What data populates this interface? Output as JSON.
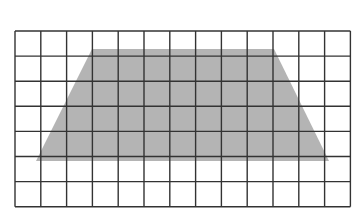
{
  "figure": {
    "type": "grid-diagram",
    "grid": {
      "columns": 13,
      "rows": 7,
      "origin_x": 15,
      "origin_y": 31,
      "cell_width": 25.8,
      "cell_height": 25.1,
      "line_color": "#333333",
      "background": "#ffffff"
    },
    "shape": {
      "name": "trapezoid",
      "fill": "#b4b4b4",
      "vertices_px": [
        [
          92,
          49
        ],
        [
          274,
          49
        ],
        [
          329,
          161
        ],
        [
          36,
          161
        ]
      ]
    }
  }
}
